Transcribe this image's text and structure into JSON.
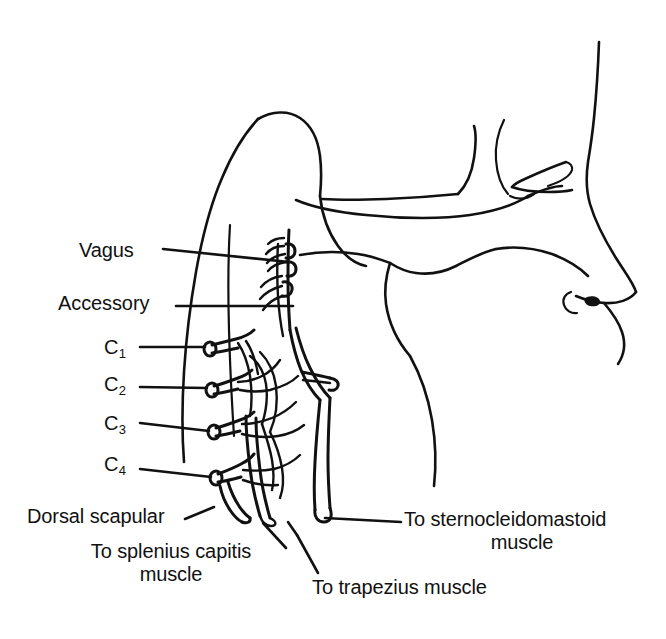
{
  "figure": {
    "background_color": "#ffffff",
    "line_color": "#111111"
  },
  "labels": {
    "vagus": "Vagus",
    "accessory": "Accessory",
    "c1": "C",
    "c1_sub": "1",
    "c2": "C",
    "c2_sub": "2",
    "c3": "C",
    "c3_sub": "3",
    "c4": "C",
    "c4_sub": "4",
    "dorsal_scapular": "Dorsal scapular",
    "splenius_line1": "To splenius capitis",
    "splenius_line2": "muscle",
    "sternocleidomastoid_line1": "To sternocleidomastoid",
    "sternocleidomastoid_line2": "muscle",
    "trapezius": "To trapezius muscle"
  }
}
